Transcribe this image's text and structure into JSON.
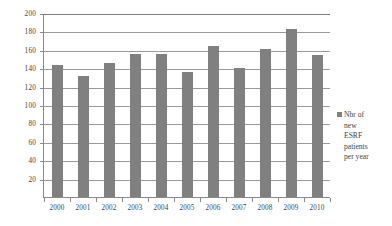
{
  "chart_data": {
    "type": "bar",
    "title": "",
    "subtitle": "",
    "xlabel": "",
    "ylabel": "",
    "categories": [
      "2000",
      "2001",
      "2002",
      "2003",
      "2004",
      "2005",
      "2006",
      "2007",
      "2008",
      "2009",
      "2010"
    ],
    "values": [
      145,
      133,
      147,
      156,
      157,
      137,
      165,
      141,
      162,
      184,
      155
    ],
    "series": [
      {
        "name": "Nbr of new ESRF patients per year",
        "values": [
          145,
          133,
          147,
          156,
          157,
          137,
          165,
          141,
          162,
          184,
          155
        ],
        "color": "#808080"
      }
    ],
    "ylim": [
      0,
      200
    ],
    "yticks": [
      20,
      40,
      60,
      80,
      100,
      120,
      140,
      160,
      180,
      200
    ],
    "ytick_labels": [
      "20",
      "40",
      "60",
      "80",
      "100",
      "120",
      "140",
      "160",
      "180",
      "200"
    ],
    "grid": true,
    "grid_axis": "y",
    "legend_position": "right",
    "legend_entries": [
      "Nbr of new ESRF patients per year"
    ]
  },
  "legend": {
    "swatch_color": "#808080",
    "label": "Nbr of new ESRF pa­tients per year"
  },
  "colors": {
    "bar": "#808080",
    "gridline": "#9a9a9a",
    "axis": "#8a8a8a",
    "text": "#3f3f3f",
    "background": "#ffffff"
  }
}
